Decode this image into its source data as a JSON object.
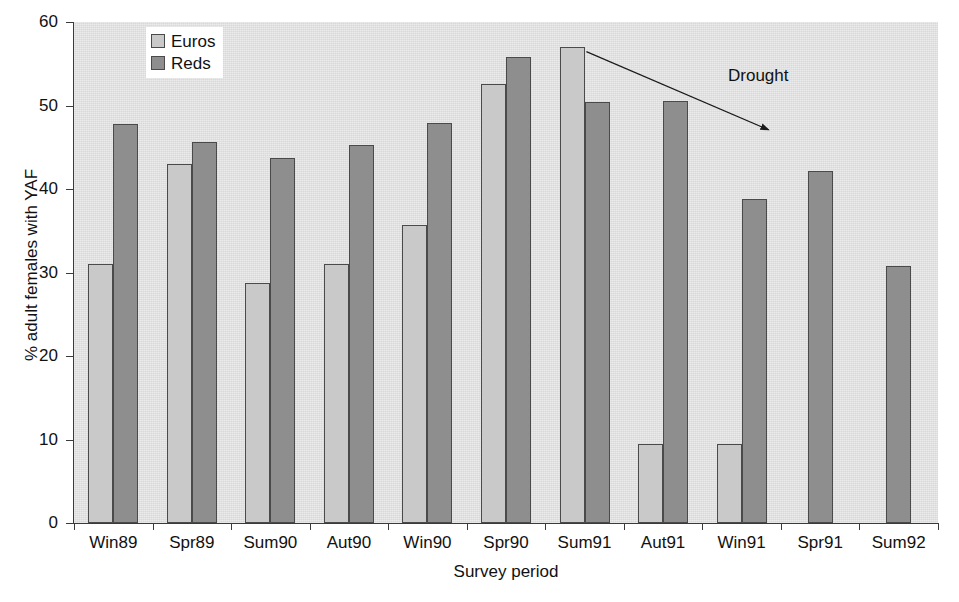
{
  "chart_data": {
    "type": "bar",
    "title": "",
    "xlabel": "Survey period",
    "ylabel": "% adult females with YAF",
    "ylim": [
      0,
      60
    ],
    "yticks": [
      0,
      10,
      20,
      30,
      40,
      50,
      60
    ],
    "ytick_labels": [
      "0",
      "10",
      "20",
      "30",
      "40",
      "50",
      "60"
    ],
    "grid": false,
    "legend_position": "top-center-left",
    "categories": [
      "Win89",
      "Spr89",
      "Sum90",
      "Aut90",
      "Win90",
      "Spr90",
      "Sum91",
      "Aut91",
      "Win91",
      "Spr91",
      "Sum92"
    ],
    "series": [
      {
        "name": "Euros",
        "color": "#c9c9c9",
        "values": [
          31,
          43,
          28.8,
          31,
          35.7,
          52.6,
          57,
          9.5,
          9.5,
          null,
          null
        ]
      },
      {
        "name": "Reds",
        "color": "#8e8e8e",
        "values": [
          47.8,
          45.6,
          43.7,
          45.3,
          47.9,
          55.8,
          50.4,
          50.5,
          38.8,
          42.1,
          30.8
        ]
      }
    ],
    "annotations": [
      {
        "text": "Drought",
        "type": "arrow-with-label",
        "arrow_from": [
          665,
          62
        ],
        "arrow_to": [
          886,
          158
        ]
      }
    ]
  },
  "axis": {
    "y_title": "% adult females with YAF",
    "x_title": "Survey period"
  },
  "legend": {
    "items": [
      {
        "label": "Euros",
        "swatch": "light-gray-square"
      },
      {
        "label": "Reds",
        "swatch": "dark-gray-square"
      }
    ]
  },
  "annotation": {
    "drought_label": "Drought"
  },
  "colors": {
    "plot_background": "#d9d9d9",
    "euros": "#c9c9c9",
    "reds": "#8e8e8e",
    "axis": "#3a3a3a",
    "text": "#111111"
  }
}
